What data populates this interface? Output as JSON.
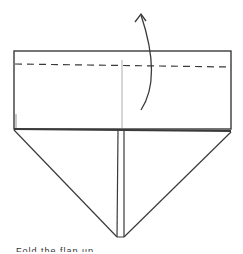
{
  "diagram": {
    "elements": {
      "top_flap": "rectangular band",
      "fold_line": "dashed valley fold",
      "center_crease": "vertical crease line",
      "arrow": "curved fold-up arrow",
      "triangle": "downward-pointing kite/triangle with center slit"
    },
    "colors": {
      "line": "#3a3a3a",
      "crease": "#9a9a9a",
      "background": "#ffffff"
    }
  },
  "caption": {
    "text": "Fold the flap up"
  }
}
